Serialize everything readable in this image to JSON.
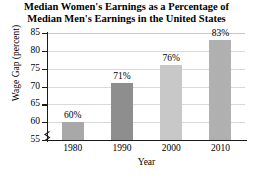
{
  "chart_data": {
    "type": "bar",
    "title": "Median Women's Earnings as a Percentage of Median Men's Earnings in the United States",
    "title_lines": [
      "Median Women's Earnings as a Percentage of",
      "Median Men's Earnings in the United States"
    ],
    "xlabel": "Year",
    "ylabel": "Wage Gap (percent)",
    "categories": [
      "1980",
      "1990",
      "2000",
      "2010"
    ],
    "values": [
      60,
      71,
      76,
      83
    ],
    "data_labels": [
      "60%",
      "71%",
      "76%",
      "83%"
    ],
    "ylim": [
      55,
      85
    ],
    "yticks": [
      55,
      60,
      65,
      70,
      75,
      80,
      85
    ],
    "ytick_labels": [
      "55",
      "60",
      "65",
      "70",
      "75",
      "80",
      "85"
    ],
    "grid": true,
    "grid_axis": "y",
    "legend": false,
    "axis_break": true,
    "bar_colors": [
      "#a8a8a8",
      "#8e8e8e",
      "#c8c8c8",
      "#b0b0b0"
    ],
    "axis_color": "#1a1a1a",
    "gridline_color": "#d9d9d9",
    "background": "#ffffff"
  }
}
